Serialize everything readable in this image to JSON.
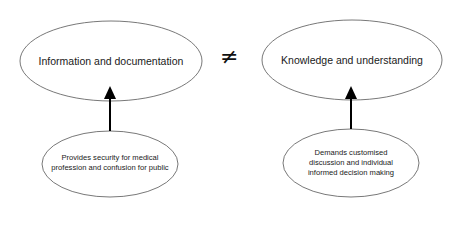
{
  "diagram": {
    "top_nodes": [
      {
        "id": "info",
        "label": "Information and documentation"
      },
      {
        "id": "knowledge",
        "label": "Knowledge and understanding"
      }
    ],
    "relation_symbol": "≠",
    "bottom_nodes": [
      {
        "id": "info-effect",
        "label": "Provides security for medical profession and confusion for public"
      },
      {
        "id": "knowledge-effect",
        "label": "Demands customised discussion and individual informed decision making"
      }
    ],
    "edges": [
      {
        "from": "info-effect",
        "to": "info",
        "type": "arrow"
      },
      {
        "from": "knowledge-effect",
        "to": "knowledge",
        "type": "arrow"
      }
    ],
    "colors": {
      "stroke": "#444444",
      "arrow": "#000000",
      "text": "#1a1a1a"
    }
  }
}
